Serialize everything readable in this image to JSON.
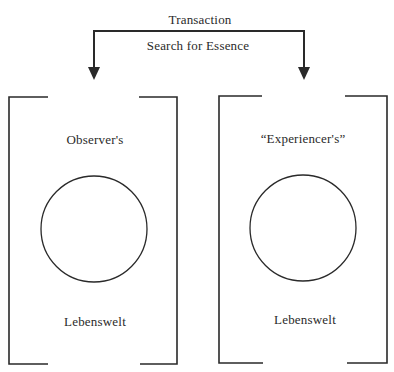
{
  "diagram": {
    "top_labels": {
      "above_bracket": "Transaction",
      "below_bracket": "Search for Essence"
    },
    "panels": [
      {
        "id": "observer",
        "top_label": "Observer's",
        "bottom_label": "Lebenswelt"
      },
      {
        "id": "experiencer",
        "top_label": "“Experiencer's”",
        "bottom_label": "Lebenswelt"
      }
    ],
    "colors": {
      "line": "#2a2a2a",
      "background": "#ffffff"
    }
  }
}
